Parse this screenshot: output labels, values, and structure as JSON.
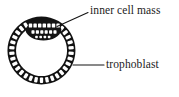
{
  "figure": {
    "name": "blastocyst-diagram",
    "title": "",
    "background_color": "#ffffff",
    "ink_color": "#111111",
    "text_color": "#1b1b1b"
  },
  "labels": [
    {
      "id": "inner-cell-mass",
      "text": "inner cell mass",
      "leader": {
        "from_x": 88,
        "from_y": 12.5,
        "to_x": 57,
        "to_y": 26.5
      }
    },
    {
      "id": "trophoblast",
      "text": "trophoblast",
      "leader": {
        "from_x": 104,
        "from_y": 65,
        "to_x": 73,
        "to_y": 65
      }
    }
  ],
  "structures": {
    "trophoblast": {
      "name": "trophoblast",
      "description": "ring of cuboidal cells forming outer wall",
      "center_x": 41.5,
      "center_y": 50.5,
      "outer_radius": 34,
      "inner_radius": 25.5,
      "cell_count": 34
    },
    "blastocoel": {
      "name": "blastocoel",
      "description": "fluid filled cavity",
      "fill": "#ffffff"
    },
    "inner_cell_mass": {
      "name": "inner cell mass",
      "description": "dark lens shaped cluster of cells at upper pole",
      "center_x": 44,
      "center_y": 29,
      "width": 36,
      "height": 17,
      "cell_count": 16
    }
  }
}
